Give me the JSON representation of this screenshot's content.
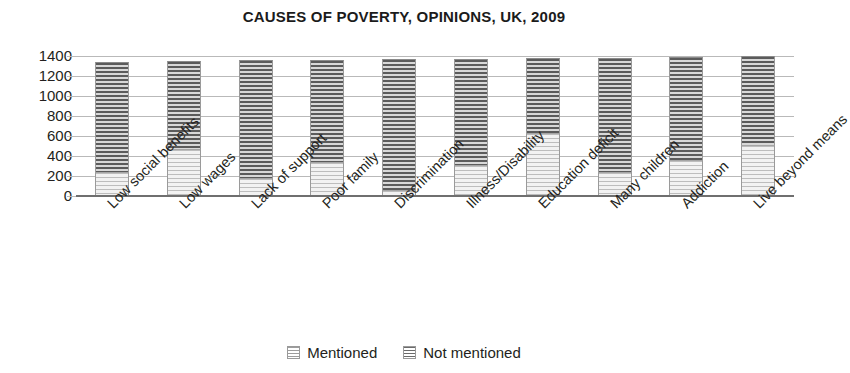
{
  "chart_data": {
    "type": "bar",
    "title": "CAUSES OF POVERTY, OPINIONS, UK, 2009",
    "subtitle": "",
    "xlabel": "",
    "ylabel": "",
    "stacked": true,
    "grid": true,
    "legend_position": "bottom",
    "ylim": [
      0,
      1400
    ],
    "yticks": [
      0,
      200,
      400,
      600,
      800,
      1000,
      1200,
      1400
    ],
    "ytick_labels": [
      "0",
      "200",
      "400",
      "600",
      "800",
      "1000",
      "1200",
      "1400"
    ],
    "categories": [
      "Low social benefits",
      "Low wages",
      "Lack of support",
      "Poor family",
      "Discrimination",
      "Illness/Disability",
      "Education deficit",
      "Many children",
      "Addiction",
      "Live beyond means"
    ],
    "series": [
      {
        "name": "Mentioned",
        "color": "#cfcfcf",
        "values": [
          240,
          470,
          180,
          340,
          60,
          310,
          630,
          240,
          360,
          510
        ]
      },
      {
        "name": "Not mentioned",
        "color": "#5b5b5b",
        "values": [
          1100,
          880,
          1180,
          1020,
          1310,
          1060,
          750,
          1140,
          1030,
          890
        ]
      }
    ],
    "totals": [
      1340,
      1350,
      1360,
      1360,
      1370,
      1370,
      1380,
      1380,
      1390,
      1400
    ]
  },
  "legend": {
    "items": [
      {
        "label": "Mentioned",
        "swatch": "light-striped-swatch"
      },
      {
        "label": "Not mentioned",
        "swatch": "dark-striped-swatch"
      }
    ]
  }
}
